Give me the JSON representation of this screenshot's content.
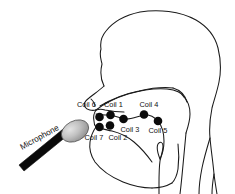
{
  "figure": {
    "type": "diagram",
    "background_color": "#ffffff",
    "line_color": "#1a1a1a",
    "dot_color": "#0b0b0b",
    "canvas": {
      "width": 235,
      "height": 194
    }
  },
  "microphone": {
    "label": "Microphone",
    "label_rotation_deg": -29,
    "head_color_light": "#d9d9d9",
    "head_color_dark": "#8c8c8c",
    "stick_color": "#0a0a0a"
  },
  "coils": [
    {
      "id": "coil-1",
      "label": "Coil 1",
      "dot_x": 110.5,
      "dot_y": 115.0,
      "label_x": 104.0,
      "label_y": 107.0
    },
    {
      "id": "coil-2",
      "label": "Coil 2",
      "dot_x": 110.0,
      "dot_y": 125.5,
      "label_x": 108.5,
      "label_y": 139.5
    },
    {
      "id": "coil-3",
      "label": "Coil 3",
      "dot_x": 123.5,
      "dot_y": 119.0,
      "label_x": 120.5,
      "label_y": 131.5
    },
    {
      "id": "coil-4",
      "label": "Coil 4",
      "dot_x": 144.0,
      "dot_y": 114.5,
      "label_x": 139.5,
      "label_y": 107.0
    },
    {
      "id": "coil-5",
      "label": "Coil 5",
      "dot_x": 158.0,
      "dot_y": 121.0,
      "label_x": 148.5,
      "label_y": 133.0
    },
    {
      "id": "coil-6",
      "label": "Coil 6",
      "dot_x": 99.5,
      "dot_y": 117.0,
      "label_x": 77.0,
      "label_y": 107.0
    },
    {
      "id": "coil-7",
      "label": "Coil 7",
      "dot_x": 99.5,
      "dot_y": 127.0,
      "label_x": 84.5,
      "label_y": 139.5
    }
  ],
  "anatomy": {
    "parts": [
      "skull-outline",
      "nasal-cavity",
      "hard-palate",
      "soft-palate",
      "upper-lip",
      "lower-lip",
      "tongue-surface",
      "tongue-body",
      "jaw",
      "epiglottis",
      "pharynx",
      "neck-front",
      "neck-back"
    ]
  }
}
